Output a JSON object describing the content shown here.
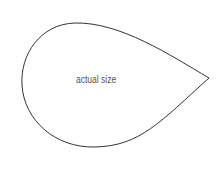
{
  "diagram": {
    "shape": "teardrop",
    "label": "actual size",
    "stroke_color": "#333333",
    "label_color": "#555555"
  }
}
